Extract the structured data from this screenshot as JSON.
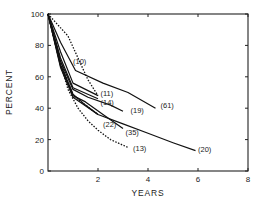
{
  "chart_data": {
    "type": "line",
    "title": "",
    "xlabel": "YEARS",
    "ylabel": "PERCENT",
    "xlim": [
      0,
      8
    ],
    "ylim": [
      0,
      100
    ],
    "xticks": [
      2,
      4,
      6,
      8
    ],
    "yticks": [
      0,
      20,
      40,
      60,
      80,
      100
    ],
    "grid": false,
    "legend": "inline labels at series ends",
    "series": [
      {
        "name": "(10)",
        "style": "dotted",
        "x": [
          0,
          0.8,
          1.2,
          1.6,
          2.0
        ],
        "y": [
          100,
          86,
          72,
          58,
          48
        ]
      },
      {
        "name": "(61)",
        "style": "solid",
        "x": [
          0,
          0.5,
          1.1,
          2.2,
          3.2,
          4.3
        ],
        "y": [
          100,
          82,
          64,
          56,
          50,
          40
        ]
      },
      {
        "name": "(11)",
        "style": "solid",
        "x": [
          0,
          0.5,
          1.0,
          2.0
        ],
        "y": [
          100,
          76,
          56,
          48
        ]
      },
      {
        "name": "(14)",
        "style": "solid",
        "x": [
          0,
          0.5,
          1.0,
          2.0
        ],
        "y": [
          100,
          72,
          53,
          46
        ]
      },
      {
        "name": "(19)",
        "style": "solid",
        "x": [
          0,
          0.5,
          1.0,
          1.6,
          2.5,
          3.0
        ],
        "y": [
          100,
          70,
          52,
          47,
          42,
          38
        ]
      },
      {
        "name": "(22)",
        "style": "solid",
        "x": [
          0,
          0.5,
          1.0,
          1.5,
          2.0
        ],
        "y": [
          100,
          68,
          49,
          42,
          36
        ]
      },
      {
        "name": "(35)",
        "style": "solid",
        "x": [
          0,
          0.5,
          1.0,
          1.5,
          2.2,
          3.0
        ],
        "y": [
          100,
          67,
          48,
          44,
          36,
          27
        ]
      },
      {
        "name": "(20)",
        "style": "solid",
        "x": [
          0,
          0.5,
          1.0,
          2.0,
          3.0,
          4.0,
          5.0,
          5.9
        ],
        "y": [
          100,
          66,
          47,
          36,
          30,
          24,
          18,
          13
        ]
      },
      {
        "name": "(13)",
        "style": "dotted",
        "x": [
          0,
          0.4,
          0.8,
          1.2,
          1.6,
          2.0,
          2.5,
          3.2
        ],
        "y": [
          100,
          74,
          52,
          40,
          32,
          26,
          20,
          15
        ]
      },
      {
        "name": "",
        "style": "dotted",
        "x": [
          0,
          0.5,
          1.0,
          1.5,
          2.0
        ],
        "y": [
          100,
          70,
          48,
          42,
          36
        ]
      }
    ],
    "labels": [
      {
        "text": "(10)",
        "x": 1.0,
        "y": 68
      },
      {
        "text": "(11)",
        "x": 2.1,
        "y": 48
      },
      {
        "text": "(14)",
        "x": 2.1,
        "y": 42
      },
      {
        "text": "(19)",
        "x": 3.3,
        "y": 37
      },
      {
        "text": "(61)",
        "x": 4.5,
        "y": 40
      },
      {
        "text": "(22)",
        "x": 2.2,
        "y": 28
      },
      {
        "text": "(35)",
        "x": 3.1,
        "y": 23
      },
      {
        "text": "(13)",
        "x": 3.4,
        "y": 13
      },
      {
        "text": "(20)",
        "x": 6.0,
        "y": 12
      }
    ]
  },
  "axes": {
    "xlabel": "YEARS",
    "ylabel": "PERCENT"
  }
}
